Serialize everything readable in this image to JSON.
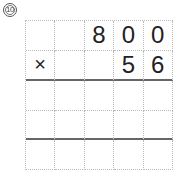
{
  "problem": {
    "number": "10",
    "operator": "×",
    "multiplicand": [
      "8",
      "0",
      "0"
    ],
    "multiplier": [
      "5",
      "6"
    ]
  },
  "grid": {
    "rows": [
      [
        "",
        "",
        "8",
        "0",
        "0"
      ],
      [
        "×",
        "",
        "",
        "5",
        "6"
      ],
      [
        "",
        "",
        "",
        "",
        ""
      ],
      [
        "",
        "",
        "",
        "",
        ""
      ],
      [
        "",
        "",
        "",
        "",
        ""
      ]
    ]
  }
}
